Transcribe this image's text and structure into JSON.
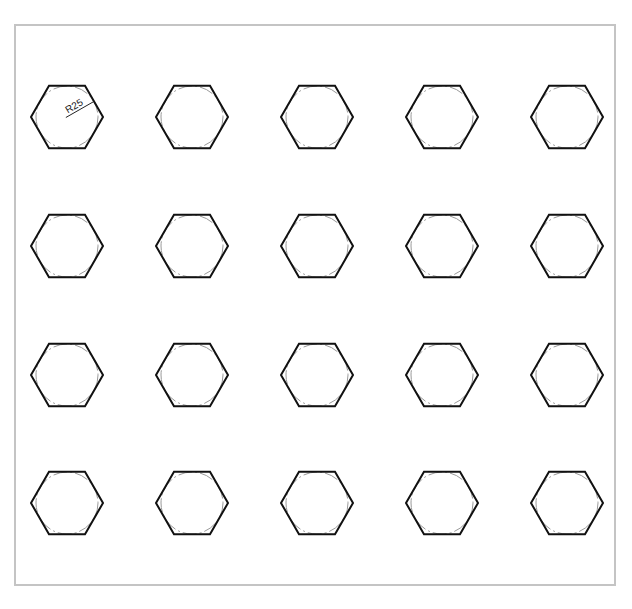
{
  "caption": "",
  "frame": {
    "border_color": "#c4c4c4"
  },
  "grid": {
    "rows": 4,
    "cols": 5,
    "col_centers": [
      67,
      192,
      317,
      442,
      567
    ],
    "row_centers": [
      117,
      246,
      375,
      503
    ],
    "hex_radius": 36,
    "circle_radius": 31,
    "stroke_color": "#111111",
    "circle_color": "#999999"
  },
  "dimension": {
    "label": "R25",
    "row": 0,
    "col": 0
  }
}
